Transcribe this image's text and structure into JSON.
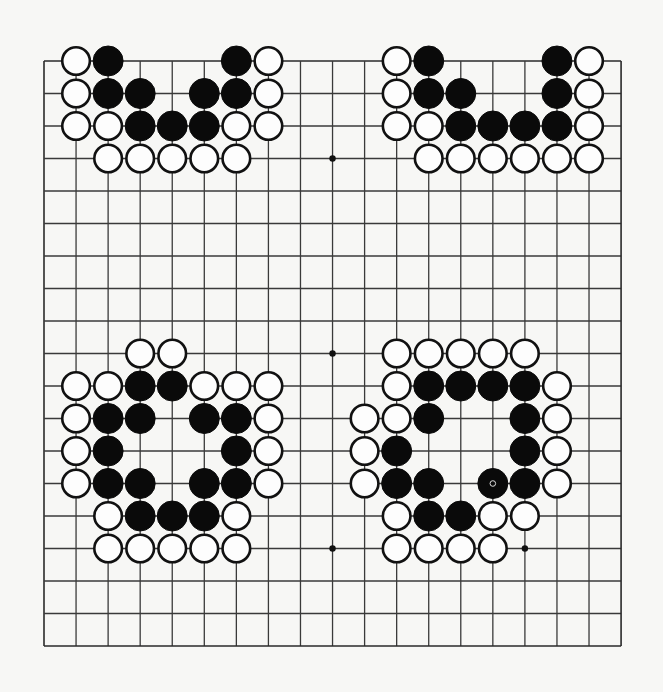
{
  "board": {
    "size": 19,
    "origin": {
      "x": 44,
      "y": 61
    },
    "spacing": {
      "x": 32.06,
      "y": 32.5
    },
    "stone_radius": 15,
    "colors": {
      "background": "#f7f7f5",
      "line": "#3a3a3a",
      "black_stone": "#0a0a0a",
      "white_stone": "#fdfdfd"
    },
    "star_points": [
      {
        "col": 9,
        "row": 3
      },
      {
        "col": 9,
        "row": 9
      },
      {
        "col": 9,
        "row": 15
      },
      {
        "col": 15,
        "row": 15
      }
    ],
    "last_move": {
      "col": 14,
      "row": 13,
      "color": "black",
      "marker": "circle"
    },
    "stones": [
      {
        "c": 1,
        "r": 0,
        "s": "W"
      },
      {
        "c": 2,
        "r": 0,
        "s": "B"
      },
      {
        "c": 6,
        "r": 0,
        "s": "B"
      },
      {
        "c": 7,
        "r": 0,
        "s": "W"
      },
      {
        "c": 1,
        "r": 1,
        "s": "W"
      },
      {
        "c": 2,
        "r": 1,
        "s": "B"
      },
      {
        "c": 3,
        "r": 1,
        "s": "B"
      },
      {
        "c": 5,
        "r": 1,
        "s": "B"
      },
      {
        "c": 6,
        "r": 1,
        "s": "B"
      },
      {
        "c": 7,
        "r": 1,
        "s": "W"
      },
      {
        "c": 1,
        "r": 2,
        "s": "W"
      },
      {
        "c": 2,
        "r": 2,
        "s": "W"
      },
      {
        "c": 3,
        "r": 2,
        "s": "B"
      },
      {
        "c": 4,
        "r": 2,
        "s": "B"
      },
      {
        "c": 5,
        "r": 2,
        "s": "B"
      },
      {
        "c": 6,
        "r": 2,
        "s": "W"
      },
      {
        "c": 7,
        "r": 2,
        "s": "W"
      },
      {
        "c": 2,
        "r": 3,
        "s": "W"
      },
      {
        "c": 3,
        "r": 3,
        "s": "W"
      },
      {
        "c": 4,
        "r": 3,
        "s": "W"
      },
      {
        "c": 5,
        "r": 3,
        "s": "W"
      },
      {
        "c": 6,
        "r": 3,
        "s": "W"
      },
      {
        "c": 11,
        "r": 0,
        "s": "W"
      },
      {
        "c": 12,
        "r": 0,
        "s": "B"
      },
      {
        "c": 16,
        "r": 0,
        "s": "B"
      },
      {
        "c": 17,
        "r": 0,
        "s": "W"
      },
      {
        "c": 11,
        "r": 1,
        "s": "W"
      },
      {
        "c": 12,
        "r": 1,
        "s": "B"
      },
      {
        "c": 13,
        "r": 1,
        "s": "B"
      },
      {
        "c": 16,
        "r": 1,
        "s": "B"
      },
      {
        "c": 17,
        "r": 1,
        "s": "W"
      },
      {
        "c": 11,
        "r": 2,
        "s": "W"
      },
      {
        "c": 12,
        "r": 2,
        "s": "W"
      },
      {
        "c": 13,
        "r": 2,
        "s": "B"
      },
      {
        "c": 14,
        "r": 2,
        "s": "B"
      },
      {
        "c": 15,
        "r": 2,
        "s": "B"
      },
      {
        "c": 16,
        "r": 2,
        "s": "B"
      },
      {
        "c": 17,
        "r": 2,
        "s": "W"
      },
      {
        "c": 12,
        "r": 3,
        "s": "W"
      },
      {
        "c": 13,
        "r": 3,
        "s": "W"
      },
      {
        "c": 14,
        "r": 3,
        "s": "W"
      },
      {
        "c": 15,
        "r": 3,
        "s": "W"
      },
      {
        "c": 16,
        "r": 3,
        "s": "W"
      },
      {
        "c": 17,
        "r": 3,
        "s": "W"
      },
      {
        "c": 3,
        "r": 9,
        "s": "W"
      },
      {
        "c": 4,
        "r": 9,
        "s": "W"
      },
      {
        "c": 1,
        "r": 10,
        "s": "W"
      },
      {
        "c": 2,
        "r": 10,
        "s": "W"
      },
      {
        "c": 3,
        "r": 10,
        "s": "B"
      },
      {
        "c": 4,
        "r": 10,
        "s": "B"
      },
      {
        "c": 5,
        "r": 10,
        "s": "W"
      },
      {
        "c": 6,
        "r": 10,
        "s": "W"
      },
      {
        "c": 7,
        "r": 10,
        "s": "W"
      },
      {
        "c": 1,
        "r": 11,
        "s": "W"
      },
      {
        "c": 2,
        "r": 11,
        "s": "B"
      },
      {
        "c": 3,
        "r": 11,
        "s": "B"
      },
      {
        "c": 5,
        "r": 11,
        "s": "B"
      },
      {
        "c": 6,
        "r": 11,
        "s": "B"
      },
      {
        "c": 7,
        "r": 11,
        "s": "W"
      },
      {
        "c": 1,
        "r": 12,
        "s": "W"
      },
      {
        "c": 2,
        "r": 12,
        "s": "B"
      },
      {
        "c": 6,
        "r": 12,
        "s": "B"
      },
      {
        "c": 7,
        "r": 12,
        "s": "W"
      },
      {
        "c": 1,
        "r": 13,
        "s": "W"
      },
      {
        "c": 2,
        "r": 13,
        "s": "B"
      },
      {
        "c": 3,
        "r": 13,
        "s": "B"
      },
      {
        "c": 5,
        "r": 13,
        "s": "B"
      },
      {
        "c": 6,
        "r": 13,
        "s": "B"
      },
      {
        "c": 7,
        "r": 13,
        "s": "W"
      },
      {
        "c": 2,
        "r": 14,
        "s": "W"
      },
      {
        "c": 3,
        "r": 14,
        "s": "B"
      },
      {
        "c": 4,
        "r": 14,
        "s": "B"
      },
      {
        "c": 5,
        "r": 14,
        "s": "B"
      },
      {
        "c": 6,
        "r": 14,
        "s": "W"
      },
      {
        "c": 2,
        "r": 15,
        "s": "W"
      },
      {
        "c": 3,
        "r": 15,
        "s": "W"
      },
      {
        "c": 4,
        "r": 15,
        "s": "W"
      },
      {
        "c": 5,
        "r": 15,
        "s": "W"
      },
      {
        "c": 6,
        "r": 15,
        "s": "W"
      },
      {
        "c": 11,
        "r": 9,
        "s": "W"
      },
      {
        "c": 12,
        "r": 9,
        "s": "W"
      },
      {
        "c": 13,
        "r": 9,
        "s": "W"
      },
      {
        "c": 14,
        "r": 9,
        "s": "W"
      },
      {
        "c": 15,
        "r": 9,
        "s": "W"
      },
      {
        "c": 11,
        "r": 10,
        "s": "W"
      },
      {
        "c": 12,
        "r": 10,
        "s": "B"
      },
      {
        "c": 13,
        "r": 10,
        "s": "B"
      },
      {
        "c": 14,
        "r": 10,
        "s": "B"
      },
      {
        "c": 15,
        "r": 10,
        "s": "B"
      },
      {
        "c": 16,
        "r": 10,
        "s": "W"
      },
      {
        "c": 10,
        "r": 11,
        "s": "W"
      },
      {
        "c": 11,
        "r": 11,
        "s": "W"
      },
      {
        "c": 12,
        "r": 11,
        "s": "B"
      },
      {
        "c": 15,
        "r": 11,
        "s": "B"
      },
      {
        "c": 16,
        "r": 11,
        "s": "W"
      },
      {
        "c": 10,
        "r": 12,
        "s": "W"
      },
      {
        "c": 11,
        "r": 12,
        "s": "B"
      },
      {
        "c": 15,
        "r": 12,
        "s": "B"
      },
      {
        "c": 16,
        "r": 12,
        "s": "W"
      },
      {
        "c": 10,
        "r": 13,
        "s": "W"
      },
      {
        "c": 11,
        "r": 13,
        "s": "B"
      },
      {
        "c": 12,
        "r": 13,
        "s": "B"
      },
      {
        "c": 14,
        "r": 13,
        "s": "B"
      },
      {
        "c": 15,
        "r": 13,
        "s": "B"
      },
      {
        "c": 16,
        "r": 13,
        "s": "W"
      },
      {
        "c": 11,
        "r": 14,
        "s": "W"
      },
      {
        "c": 12,
        "r": 14,
        "s": "B"
      },
      {
        "c": 13,
        "r": 14,
        "s": "B"
      },
      {
        "c": 14,
        "r": 14,
        "s": "W"
      },
      {
        "c": 15,
        "r": 14,
        "s": "W"
      },
      {
        "c": 11,
        "r": 15,
        "s": "W"
      },
      {
        "c": 12,
        "r": 15,
        "s": "W"
      },
      {
        "c": 13,
        "r": 15,
        "s": "W"
      },
      {
        "c": 14,
        "r": 15,
        "s": "W"
      }
    ]
  }
}
